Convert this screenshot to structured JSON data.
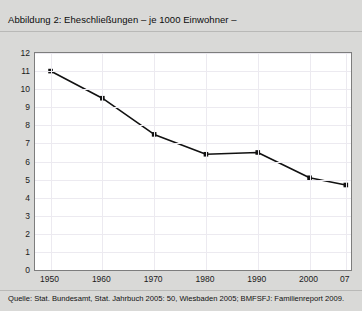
{
  "figure": {
    "title": "Abbildung 2: Eheschließungen – je 1000 Einwohner –",
    "source": "Quelle: Stat. Bundesamt, Stat. Jahrbuch 2005: 50, Wiesbaden 2005; BMFSFJ: Familienreport 2009.",
    "background_color": "#d9d9d7",
    "plot_background_color": "#ffffff",
    "line_color": "#111111",
    "grid_color": "#eceaf0",
    "frame_color": "#7d7d7d"
  },
  "chart_data": {
    "type": "line",
    "title": "Abbildung 2: Eheschließungen – je 1000 Einwohner –",
    "xlabel": "",
    "ylabel": "",
    "x": [
      1950,
      1960,
      1970,
      1980,
      1990,
      2000,
      2007
    ],
    "categories": [
      "1950",
      "1960",
      "1970",
      "1980",
      "1990",
      "2000",
      "07"
    ],
    "values": [
      11.0,
      9.5,
      7.5,
      6.4,
      6.5,
      5.1,
      4.7
    ],
    "series": [
      {
        "name": "Eheschließungen je 1000 Einwohner",
        "values": [
          11.0,
          9.5,
          7.5,
          6.4,
          6.5,
          5.1,
          4.7
        ]
      }
    ],
    "xlim": [
      1947,
      2008
    ],
    "ylim": [
      0,
      12
    ],
    "yticks": [
      0,
      1,
      2,
      3,
      4,
      5,
      6,
      7,
      8,
      9,
      10,
      11,
      12
    ],
    "ytick_labels": [
      "0",
      "1",
      "2",
      "3",
      "4",
      "5",
      "6",
      "7",
      "8",
      "9",
      "10",
      "11",
      "12"
    ],
    "xtick_labels": [
      "1950",
      "1960",
      "1970",
      "1980",
      "1990",
      "2000",
      "07"
    ],
    "grid": true,
    "legend": false,
    "marker": "square",
    "marker_color": "#111111",
    "line_width": 1.6
  }
}
